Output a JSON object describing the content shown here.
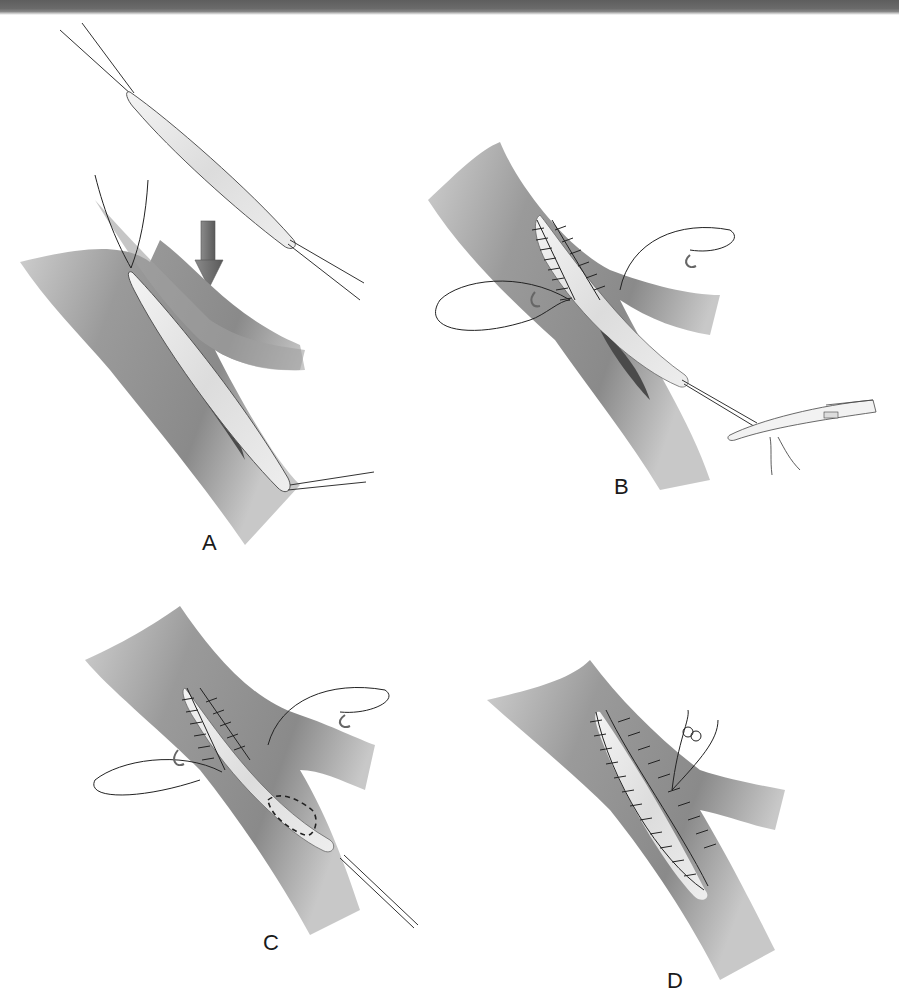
{
  "figure": {
    "panels": [
      {
        "id": "A",
        "label": "A"
      },
      {
        "id": "B",
        "label": "B"
      },
      {
        "id": "C",
        "label": "C"
      },
      {
        "id": "D",
        "label": "D"
      }
    ]
  },
  "colors": {
    "header_bar": "#666666",
    "vessel": "#9a9a9a",
    "patch": "#e6e6e6",
    "arrow": "#6e6e6e",
    "incision": "#3c3c3c",
    "suture": "#222222"
  }
}
